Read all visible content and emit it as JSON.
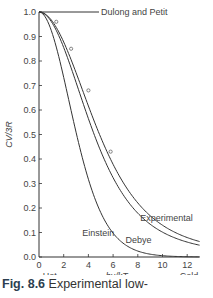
{
  "chart_data": {
    "type": "line",
    "title": "",
    "xlabel": "hν/kT",
    "ylabel": "C_V/3R",
    "xlim": [
      0,
      13
    ],
    "ylim": [
      0,
      1.0
    ],
    "x_ticks": [
      0,
      2,
      4,
      6,
      8,
      10,
      12
    ],
    "y_ticks": [
      "0.0",
      "0.1",
      "0.2",
      "0.3",
      "0.4",
      "0.5",
      "0.6",
      "0.7",
      "0.8",
      "0.9",
      "1.0"
    ],
    "grid": false,
    "x_end_labels": {
      "left": "Hot",
      "right": "Cold"
    },
    "annotations": [
      {
        "text": "Dulong and Petit",
        "x": 0,
        "y": 1.0
      },
      {
        "text": "Einstein",
        "x": 4.3,
        "y": 0.1
      },
      {
        "text": "Debye",
        "x": 7.4,
        "y": 0.07
      },
      {
        "text": "Experimental",
        "x": 8.5,
        "y": 0.15
      }
    ],
    "series": [
      {
        "name": "Einstein",
        "x": [
          0,
          1,
          2,
          3,
          4,
          5,
          6,
          7,
          8,
          9,
          10,
          11,
          12,
          13
        ],
        "values": [
          1.0,
          0.92,
          0.72,
          0.5,
          0.29,
          0.15,
          0.09,
          0.04,
          0.02,
          0.01,
          0.005,
          0.002,
          0.001,
          0.0
        ]
      },
      {
        "name": "Debye",
        "x": [
          0,
          1,
          2,
          3,
          4,
          5,
          6,
          7,
          8,
          9,
          10,
          11,
          12,
          13
        ],
        "values": [
          1.0,
          0.95,
          0.83,
          0.67,
          0.51,
          0.38,
          0.27,
          0.19,
          0.13,
          0.09,
          0.07,
          0.05,
          0.04,
          0.03
        ]
      },
      {
        "name": "Experimental",
        "x": [
          0,
          1,
          2,
          3,
          4,
          5,
          6,
          7,
          8,
          9,
          10,
          11,
          12,
          13
        ],
        "values": [
          1.0,
          0.96,
          0.85,
          0.7,
          0.54,
          0.41,
          0.3,
          0.22,
          0.16,
          0.11,
          0.08,
          0.06,
          0.05,
          0.04
        ]
      }
    ],
    "experimental_points": [
      {
        "x": 1.4,
        "y": 0.96
      },
      {
        "x": 2.6,
        "y": 0.85
      },
      {
        "x": 4.0,
        "y": 0.68
      },
      {
        "x": 5.8,
        "y": 0.43
      }
    ]
  },
  "caption": {
    "label": "Fig. 8.6",
    "text": " Experimental low-"
  }
}
